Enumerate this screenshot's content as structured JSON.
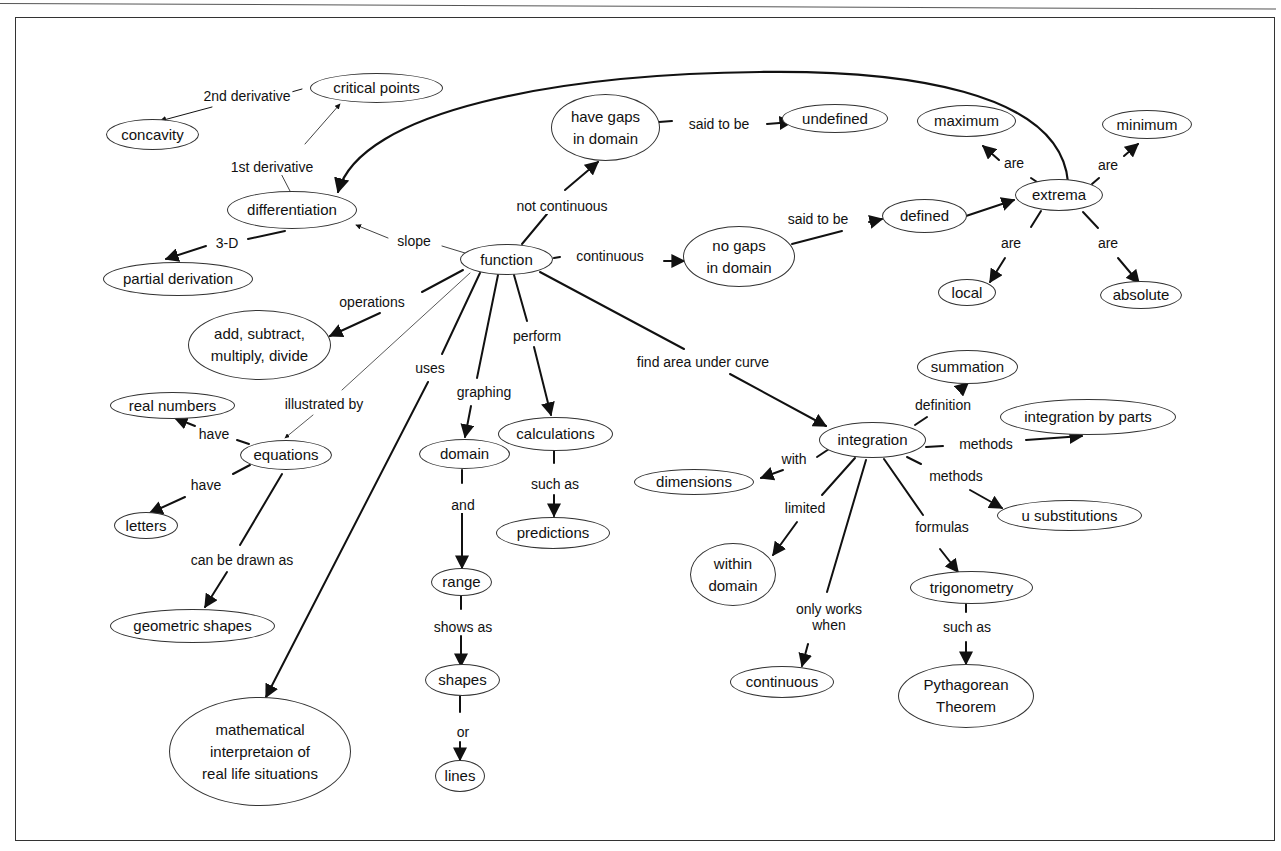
{
  "concept_map": {
    "title": "",
    "nodes": {
      "function": "function",
      "differentiation": "differentiation",
      "critical_points": "critical points",
      "concavity": "concavity",
      "partial_derivation": "partial derivation",
      "have_gaps": "have gaps\nin domain",
      "undefined": "undefined",
      "no_gaps": "no gaps\nin domain",
      "defined": "defined",
      "extrema": "extrema",
      "maximum": "maximum",
      "minimum": "minimum",
      "local": "local",
      "absolute": "absolute",
      "arithmetic": "add, subtract,\nmultiply, divide",
      "real_numbers": "real numbers",
      "equations": "equations",
      "letters": "letters",
      "geometric_shapes": "geometric shapes",
      "math_interpretation": "mathematical\ninterpretaion of\nreal life situations",
      "domain": "domain",
      "range": "range",
      "shapes": "shapes",
      "lines": "lines",
      "calculations": "calculations",
      "predictions": "predictions",
      "integration": "integration",
      "summation": "summation",
      "integration_by_parts": "integration by parts",
      "u_substitutions": "u substitutions",
      "dimensions": "dimensions",
      "within_domain": "within\ndomain",
      "continuous_node": "continuous",
      "trigonometry": "trigonometry",
      "pythagorean": "Pythagorean\nTheorem"
    },
    "links": {
      "second_derivative": "2nd derivative",
      "first_derivative": "1st derivative",
      "three_d": "3-D",
      "slope": "slope",
      "not_continuous": "not continuous",
      "said_to_be_1": "said to be",
      "continuous": "continuous",
      "said_to_be_2": "said to be",
      "are_max": "are",
      "are_min": "are",
      "are_local": "are",
      "are_abs": "are",
      "operations": "operations",
      "illustrated_by": "illustrated by",
      "have_real": "have",
      "have_letters": "have",
      "can_be_drawn_as": "can be drawn as",
      "uses": "uses",
      "graphing": "graphing",
      "and": "and",
      "shows_as": "shows as",
      "or": "or",
      "perform": "perform",
      "such_as_pred": "such as",
      "find_area": "find area under curve",
      "definition": "definition",
      "methods_1": "methods",
      "methods_2": "methods",
      "with": "with",
      "limited": "limited",
      "only_works_when": "only works\nwhen",
      "formulas": "formulas",
      "such_as_trig": "such as"
    }
  }
}
